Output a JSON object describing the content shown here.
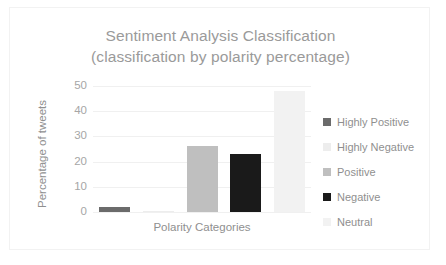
{
  "chart_data": {
    "type": "bar",
    "title": "Sentiment Analysis Classification",
    "subtitle": "(classification by polarity percentage)",
    "xlabel": "Polarity Categories",
    "ylabel": "Percentage of tweets",
    "categories": [
      "Highly Positive",
      "Highly Negative",
      "Positive",
      "Negative",
      "Neutral"
    ],
    "values": [
      2,
      0.5,
      26,
      23,
      48
    ],
    "colors": [
      "#6b6b6b",
      "#ededed",
      "#bfbfbf",
      "#1a1a1a",
      "#f2f2f2"
    ],
    "ylim": [
      0,
      50
    ],
    "yticks": [
      0,
      10,
      20,
      30,
      40,
      50
    ],
    "ytick_labels": [
      "0",
      "10",
      "20",
      "30",
      "40",
      "50"
    ],
    "grid": true,
    "legend_position": "right",
    "legend": [
      {
        "label": "Highly Positive",
        "color": "#6b6b6b"
      },
      {
        "label": "Highly Negative",
        "color": "#ededed"
      },
      {
        "label": "Positive",
        "color": "#bfbfbf"
      },
      {
        "label": "Negative",
        "color": "#1a1a1a"
      },
      {
        "label": "Neutral",
        "color": "#f2f2f2"
      }
    ]
  },
  "colors": {
    "title_text": "#9a9a9a",
    "axis_text": "#8f8f8f",
    "tick_text": "#a6a6a6",
    "gridline": "#f0f0f0",
    "frame": "#f2f2f2",
    "background": "#ffffff"
  }
}
